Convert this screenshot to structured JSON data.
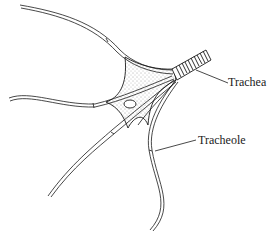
{
  "diagram": {
    "labels": {
      "trachea": "Trachea",
      "tracheole": "Tracheole"
    },
    "colors": {
      "line": "#1a1a1a",
      "background": "#ffffff",
      "stipple": "#555555"
    }
  }
}
